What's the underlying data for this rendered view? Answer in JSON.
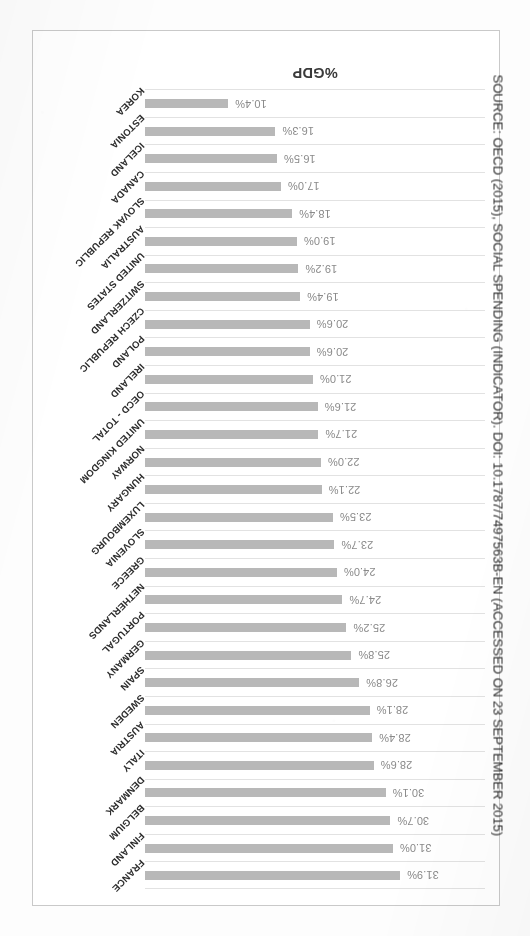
{
  "figure": {
    "axis_title": "%GDP",
    "source_note": "SOURCE: OECD (2015), SOCIAL SPENDING (INDICATOR). DOI: 10.1787/7497563B-EN (ACCESSED ON 23 SEPTEMBER 2015)",
    "bar_color": "#b8b8b8",
    "gridline_color": "#e2e2e2",
    "frame_color": "#c9c9c9",
    "value_label_color": "#8a8a8a",
    "category_label_color": "#2d2d2d",
    "rotation_degrees": 180
  },
  "chart_data": {
    "type": "bar",
    "title": "",
    "subtitle": "",
    "xlabel": "",
    "ylabel": "%GDP",
    "orientation": "horizontal",
    "grid": true,
    "legend": "none",
    "xlim": [
      0,
      31.9
    ],
    "categories": [
      "FRANCE",
      "FINLAND",
      "BELGIUM",
      "DENMARK",
      "ITALY",
      "AUSTRIA",
      "SWEDEN",
      "SPAIN",
      "GERMANY",
      "PORTUGAL",
      "NETHERLANDS",
      "GREECE",
      "SLOVENIA",
      "LUXEMBOURG",
      "HUNGARY",
      "NORWAY",
      "UNITED KINGDOM",
      "OECD - TOTAL",
      "IRELAND",
      "POLAND",
      "CZECH REPUBLIC",
      "SWITZERLAND",
      "UNITED STATES",
      "AUSTRALIA",
      "SLOVAK REPUBLIC",
      "CANADA",
      "ICELAND",
      "ESTONIA",
      "KOREA"
    ],
    "values": [
      31.9,
      31.0,
      30.7,
      30.1,
      28.6,
      28.4,
      28.1,
      26.8,
      25.8,
      25.2,
      24.7,
      24.0,
      23.7,
      23.5,
      22.1,
      22.0,
      21.7,
      21.6,
      21.0,
      20.6,
      20.6,
      19.4,
      19.2,
      19.0,
      18.4,
      17.0,
      16.5,
      16.3,
      10.4
    ],
    "value_labels": [
      "31.9%",
      "31.0%",
      "30.7%",
      "30.1%",
      "28.6%",
      "28.4%",
      "28.1%",
      "26.8%",
      "25.8%",
      "25.2%",
      "24.7%",
      "24.0%",
      "23.7%",
      "23.5%",
      "22.1%",
      "22.0%",
      "21.7%",
      "21.6%",
      "21.0%",
      "20.6%",
      "20.6%",
      "19.4%",
      "19.2%",
      "19.0%",
      "18.4%",
      "17.0%",
      "16.5%",
      "16.3%",
      "10.4%"
    ]
  }
}
